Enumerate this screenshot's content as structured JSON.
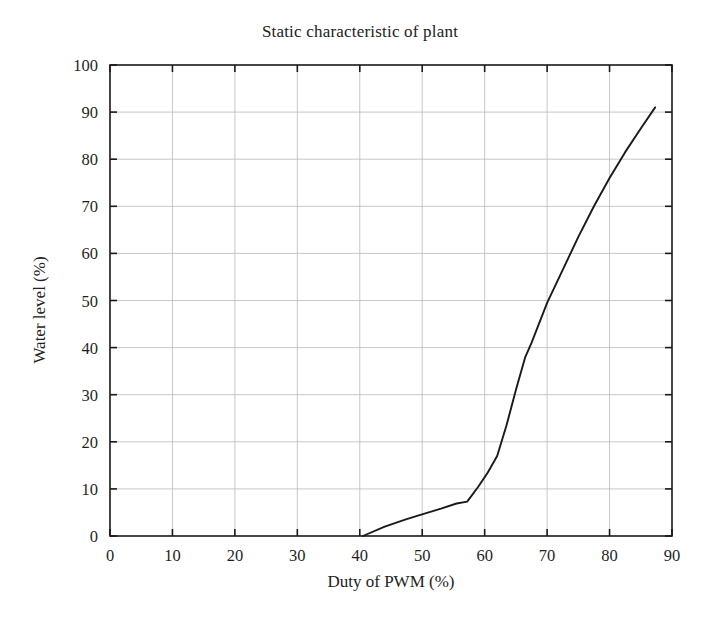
{
  "chart_data": {
    "type": "line",
    "title": "Static characteristic of plant",
    "xlabel": "Duty of PWM (%)",
    "ylabel": "Water level (%)",
    "xlim": [
      0,
      90
    ],
    "ylim": [
      0,
      100
    ],
    "xticks": [
      0,
      10,
      20,
      30,
      40,
      50,
      60,
      70,
      80,
      90
    ],
    "yticks": [
      0,
      10,
      20,
      30,
      40,
      50,
      60,
      70,
      80,
      90,
      100
    ],
    "grid": true,
    "legend": null,
    "series": [
      {
        "name": "Water level vs duty",
        "color": "#1a1a1a",
        "points": [
          [
            40.5,
            0.0
          ],
          [
            44.0,
            2.0
          ],
          [
            47.5,
            3.6
          ],
          [
            50.5,
            4.8
          ],
          [
            53.0,
            5.8
          ],
          [
            55.5,
            6.9
          ],
          [
            57.2,
            7.3
          ],
          [
            59.0,
            10.5
          ],
          [
            60.5,
            13.5
          ],
          [
            62.0,
            17.0
          ],
          [
            63.5,
            23.5
          ],
          [
            65.0,
            31.0
          ],
          [
            66.5,
            38.0
          ],
          [
            67.5,
            41.0
          ],
          [
            70.0,
            49.5
          ],
          [
            72.5,
            56.5
          ],
          [
            75.0,
            63.5
          ],
          [
            77.5,
            70.0
          ],
          [
            80.0,
            76.0
          ],
          [
            82.5,
            81.5
          ],
          [
            85.0,
            86.5
          ],
          [
            87.3,
            91.0
          ]
        ]
      }
    ]
  },
  "axes": {
    "x_tick_labels": [
      "0",
      "10",
      "20",
      "30",
      "40",
      "50",
      "60",
      "70",
      "80",
      "90"
    ],
    "y_tick_labels": [
      "0",
      "10",
      "20",
      "30",
      "40",
      "50",
      "60",
      "70",
      "80",
      "90",
      "100"
    ]
  },
  "style": {
    "grid_color": "#b9b9b9",
    "frame_color": "#1a1a1a",
    "curve_color": "#1a1a1a",
    "background": "#ffffff"
  }
}
